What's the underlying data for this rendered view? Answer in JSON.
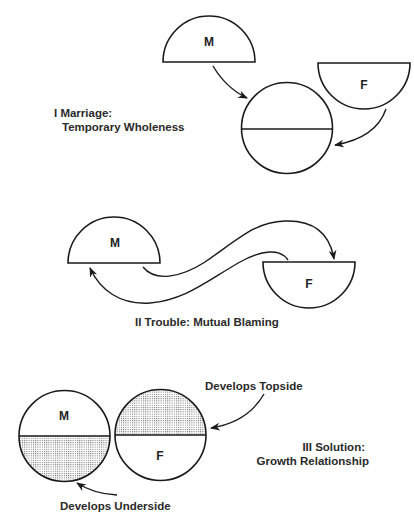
{
  "sections": [
    {
      "id": "marriage",
      "numeral": "I",
      "caption_lines": [
        "I  Marriage:",
        "Temporary Wholeness"
      ],
      "partners": {
        "male": "M",
        "female": "F"
      }
    },
    {
      "id": "trouble",
      "numeral": "II",
      "caption_lines": [
        "II  Trouble: Mutual Blaming"
      ],
      "partners": {
        "male": "M",
        "female": "F"
      }
    },
    {
      "id": "solution",
      "numeral": "III",
      "caption_lines": [
        "III  Solution:",
        "Growth Relationship"
      ],
      "partners": {
        "male": "M",
        "female": "F"
      },
      "annotations": {
        "female": "Develops Topside",
        "male": "Develops Underside"
      }
    }
  ],
  "colors": {
    "ink": "#1a1a1a",
    "stipple": "#6b6b6b",
    "paper": "#ffffff"
  }
}
